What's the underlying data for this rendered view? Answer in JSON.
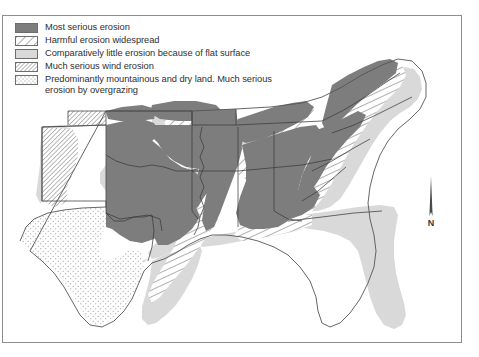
{
  "figure": {
    "kind": "thematic-map",
    "region": "Southern United States",
    "frame_color": "#8d8d8d",
    "background": "#ffffff"
  },
  "legend": {
    "items": [
      {
        "pattern": "solid-dark-gray",
        "color": "#7d7d7d",
        "label": "Most serious erosion"
      },
      {
        "pattern": "diagonal-hatch",
        "color": "#ffffff",
        "label": "Harmful erosion widespread"
      },
      {
        "pattern": "solid-light-gray",
        "color": "#d9d9d9",
        "label": "Comparatively little erosion because of flat surface"
      },
      {
        "pattern": "fine-diagonal-hatch",
        "color": "#ffffff",
        "label": "Much serious wind erosion"
      },
      {
        "pattern": "stipple-dots",
        "color": "#ffffff",
        "label": "Predominantly mountainous and dry land. Much serious\nerosion by overgrazing"
      }
    ]
  },
  "compass": {
    "label": "N",
    "icon": "north-arrow-icon"
  },
  "map_data": {
    "type": "choropleth-pattern-map",
    "colors": {
      "most_serious": "#7d7d7d",
      "little_erosion": "#d9d9d9",
      "widespread": "#ffffff",
      "wind_erosion": "#ffffff",
      "mountainous_dry": "#ffffff",
      "state_border": "#3b3b3b",
      "coast_outline": "#555555"
    },
    "regions": [
      {
        "name": "kansas",
        "class": "most-serious"
      },
      {
        "name": "western-kansas",
        "class": "wind-erosion"
      },
      {
        "name": "oklahoma",
        "class": "most-serious"
      },
      {
        "name": "oklahoma-panhandle",
        "class": "wind-erosion"
      },
      {
        "name": "texas-west",
        "class": "mountainous-dry"
      },
      {
        "name": "texas-coastal-plain",
        "class": "little-erosion"
      },
      {
        "name": "texas-east",
        "class": "most-serious"
      },
      {
        "name": "missouri",
        "class": "widespread"
      },
      {
        "name": "arkansas",
        "class": "most-serious"
      },
      {
        "name": "mississippi-valley",
        "class": "little-erosion"
      },
      {
        "name": "louisiana-coast",
        "class": "little-erosion"
      },
      {
        "name": "mississippi",
        "class": "most-serious"
      },
      {
        "name": "alabama",
        "class": "most-serious"
      },
      {
        "name": "tennessee",
        "class": "widespread"
      },
      {
        "name": "kentucky",
        "class": "most-serious"
      },
      {
        "name": "appalachians",
        "class": "widespread"
      },
      {
        "name": "virginia-piedmont",
        "class": "most-serious"
      },
      {
        "name": "atlantic-coastal-plain",
        "class": "little-erosion"
      },
      {
        "name": "georgia-piedmont",
        "class": "most-serious"
      },
      {
        "name": "florida",
        "class": "little-erosion"
      }
    ]
  }
}
